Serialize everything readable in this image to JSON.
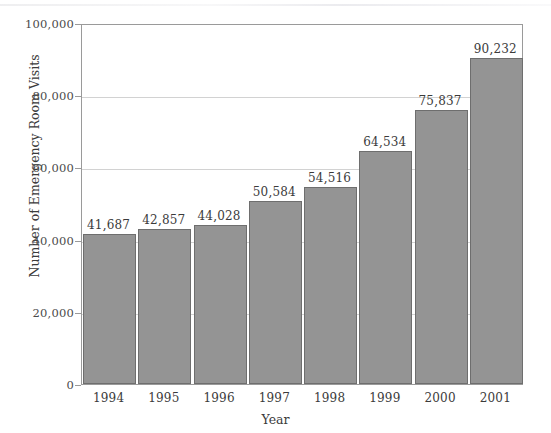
{
  "chart_data": {
    "type": "bar",
    "title": "",
    "subtitle": "",
    "xlabel": "Year",
    "ylabel": "Number of Emergency Room Visits",
    "categories": [
      "1994",
      "1995",
      "1996",
      "1997",
      "1998",
      "1999",
      "2000",
      "2001"
    ],
    "values": [
      41687,
      42857,
      44028,
      50584,
      54516,
      64534,
      75837,
      90232
    ],
    "value_labels": [
      "41,687",
      "42,857",
      "44,028",
      "50,584",
      "54,516",
      "64,534",
      "75,837",
      "90,232"
    ],
    "ylim": [
      0,
      100000
    ],
    "ytick_values": [
      0,
      20000,
      40000,
      60000,
      80000,
      100000
    ],
    "ytick_labels": [
      "0",
      "20,000",
      "40,000",
      "60,000",
      "80,000",
      "100,000"
    ],
    "grid": true,
    "legend": "none",
    "bar_color": "#949494",
    "bar_border_color": "#6e6e6e",
    "gridline_color": "#d2d2d2",
    "axis_color": "#9a9a9a",
    "background_color": "#ffffff",
    "text_color": "#3b3b3b"
  }
}
